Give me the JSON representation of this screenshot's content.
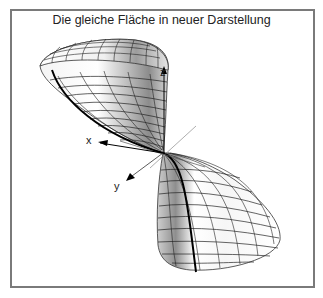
{
  "figure": {
    "title": "Die gleiche Fläche in neuer Darstellung",
    "axes": {
      "x_label": "x",
      "y_label": "y",
      "z_label": "z"
    },
    "colors": {
      "frame": "#7a7a7a",
      "mesh": "#222222",
      "surface_light": "#ffffff",
      "surface_dark": "#9a9a9a",
      "highlight_curve": "#000000"
    }
  }
}
